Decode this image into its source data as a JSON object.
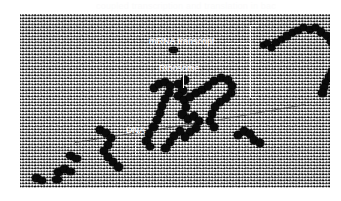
{
  "figure": {
    "type": "electron-micrograph",
    "ghost_caption": "coupled transcription and translation in bacteria",
    "background_color": "#ffffff",
    "plate_color": "#a4a4a4",
    "ink_color": "#ffffff",
    "particle_color": "#0b0b0b"
  },
  "annotations": [
    {
      "id": "mrna",
      "label": "mRNA transcript",
      "leader": "horizontal-right"
    },
    {
      "id": "ribosome",
      "label": "Ribosome",
      "leader": "vertical-down"
    },
    {
      "id": "dna",
      "label": "DNA",
      "leader": "vertical-down"
    }
  ],
  "bracket": {
    "name": "mrna-transcript-bracket",
    "orientation": "left-facing"
  }
}
